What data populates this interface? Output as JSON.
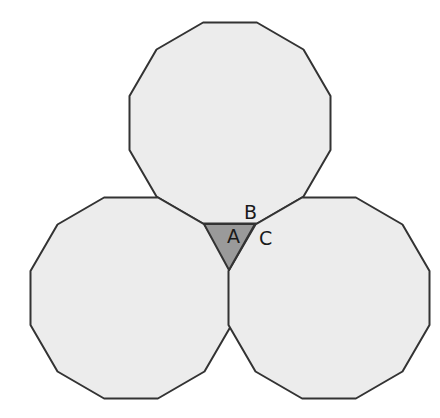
{
  "diagram": {
    "colors": {
      "polygon_fill": "#ececec",
      "triangle_fill": "#9a9a9a",
      "stroke": "#333333",
      "background": "#ffffff"
    },
    "dodecagons": [
      {
        "name": "top",
        "cx": 230,
        "cy": 123,
        "r": 104,
        "rotation_deg": 15
      },
      {
        "name": "bottom-left",
        "cx": 131,
        "cy": 298,
        "r": 104,
        "rotation_deg": 15
      },
      {
        "name": "bottom-right",
        "cx": 329,
        "cy": 298,
        "r": 104,
        "rotation_deg": 15
      }
    ],
    "triangle": {
      "points": [
        [
          204,
          224
        ],
        [
          255,
          224
        ],
        [
          229,
          270
        ]
      ]
    },
    "labels": {
      "a": {
        "text": "A",
        "x": 227,
        "y": 243
      },
      "b": {
        "text": "B",
        "x": 244,
        "y": 219
      },
      "c": {
        "text": "C",
        "x": 259,
        "y": 245
      }
    }
  }
}
